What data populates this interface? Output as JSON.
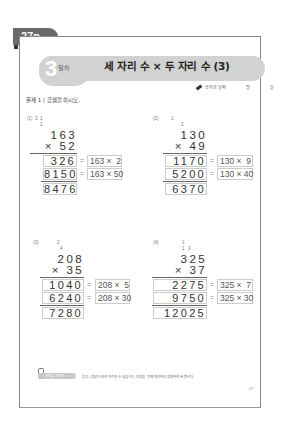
{
  "page_tab": "27p",
  "banner": {
    "day_number": "3",
    "day_label": "일차",
    "title": "세 자리 수 × 두 자리 수 (3)"
  },
  "study_date": {
    "label": "공부한 날짜",
    "month": "월",
    "day": "일"
  },
  "instruction": "문제 1 | 곱셈을 하시오.",
  "problems": [
    {
      "number": "(1)",
      "carries": [
        "3",
        "1",
        "1"
      ],
      "multiplicand": "163",
      "multiplier": "× 52",
      "partial1": "326",
      "partial1_expr": "163 ×  2",
      "partial2": "8150",
      "partial2_expr": "163 × 50",
      "result": "8476"
    },
    {
      "number": "(2)",
      "carries": [
        "1",
        "2"
      ],
      "multiplicand": "130",
      "multiplier": "× 49",
      "partial1": "1170",
      "partial1_expr": "130 ×  9",
      "partial2": "5200",
      "partial2_expr": "130 × 40",
      "result": "6370"
    },
    {
      "number": "(3)",
      "carries": [
        "2",
        "4"
      ],
      "multiplicand": "208",
      "multiplier": "× 35",
      "partial1": "1040",
      "partial1_expr": "208 ×  5",
      "partial2": "6240",
      "partial2_expr": "208 × 30",
      "result": "7280"
    },
    {
      "number": "(4)",
      "carries": [
        "1",
        "1",
        "3"
      ],
      "multiplicand": "325",
      "multiplier": "× 37",
      "partial1": "2275",
      "partial1_expr": "325 ×  7",
      "partial2": "9750",
      "partial2_expr": "325 × 30",
      "result": "12025"
    }
  ],
  "equals_sign": "=",
  "footer": {
    "badge": "선생님 한마디",
    "note": "참고 | 정답이 여러 가지일 수 있습니다. 과정을 함께 확인하고 정확하게 써 봅시다."
  },
  "page_number": "27",
  "colors": {
    "tab": "#6b6b6b",
    "banner": "#d2d2d2",
    "box_border": "#cccccc"
  }
}
